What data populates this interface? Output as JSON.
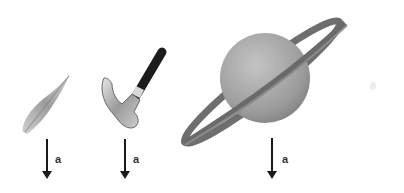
{
  "objects": [
    {
      "name": "feather",
      "arrow_label": "a"
    },
    {
      "name": "hammer",
      "arrow_label": "a"
    },
    {
      "name": "saturn",
      "arrow_label": "a"
    }
  ]
}
